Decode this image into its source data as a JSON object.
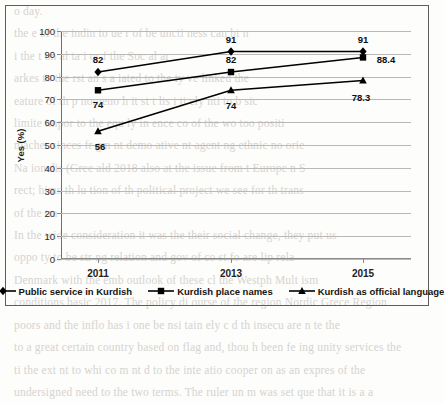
{
  "chart_data": {
    "type": "line",
    "title": "",
    "xlabel": "",
    "ylabel": "Yes (%)",
    "categories": [
      "2011",
      "2013",
      "2015"
    ],
    "ylim": [
      0,
      100
    ],
    "yticks": [
      0,
      10,
      20,
      30,
      40,
      50,
      60,
      70,
      80,
      90,
      100
    ],
    "grid": "horizontal",
    "legend_position": "bottom",
    "series": [
      {
        "name": "Public service in Kurdish",
        "marker": "diamond",
        "color": "#000000",
        "values": [
          82,
          91,
          91
        ],
        "labels": [
          "82",
          "91",
          "91"
        ]
      },
      {
        "name": "Kurdish place names",
        "marker": "square",
        "color": "#000000",
        "values": [
          74,
          82,
          88.4
        ],
        "labels": [
          "74",
          "82",
          "88.4"
        ]
      },
      {
        "name": "Kurdish as official language",
        "marker": "triangle",
        "color": "#000000",
        "values": [
          56,
          74,
          78.3
        ],
        "labels": [
          "56",
          "74",
          "78.3"
        ]
      }
    ]
  },
  "axes": {
    "y_tick_labels": [
      "100",
      "90",
      "80",
      "70",
      "60",
      "50",
      "40",
      "30",
      "20",
      "10",
      "0"
    ],
    "y_axis_title": "Yes (%)",
    "x_tick_labels": [
      "2011",
      "2013",
      "2015"
    ]
  },
  "legend": {
    "items": [
      {
        "label": "Public service in Kurdish",
        "marker": "diamond-marker"
      },
      {
        "label": "Kurdish place names",
        "marker": "square-marker"
      },
      {
        "label": "Kurdish as official language",
        "marker": "triangle-marker"
      }
    ]
  },
  "background_text": {
    "lines": [
      "o day.",
      "the e  of the  indin  to  ue   r  of be  uncti ness  can  ht  n",
      "i       the  t   on al     ta i    or    f   the  Soc al   ar",
      "arkes  to  the  rst an     s     a    iated  to  the  ty   ve   linked  the",
      "eature   of   th p  nomeno    h  it   st t   lis    i   ti ely    nti  to  b sic",
      "limite  impor  to  the  equ ly  in  ence  co   of  the  wo   too  positi",
      "macher  sinces  fr gm nt  demo ative   nt  agent  ng  ethnic  no  orie",
      "",
      "Na ionalis  (Gree   ald   2018  also   at  the   issue   from  t   Europe n  S",
      "rect;  hims  th  lu tion  of   th   political  project  we  see  for  th   trans",
      "of  the  tra",
      "In  the  wide  consideration  it  was  the  their  social  change,  they  put  us",
      "oppo   ty   to  be  str  ng  relation   and  gov    of  co st  fo   are  lip rela",
      "Denmark  with  the  emb  outlook   of  these  cl the    Westph   Mult  ism",
      "conditions  basic     2017.  The  policy  di ourse  of  the  region  Nordic  Grece  Region",
      "poors  and  the  inflo  has  i  one  be  nsi tain  ely  c  d  th   insecu   are  n   te  the",
      "to  a  great  certain  country  based  on  flag  and,  thou h  been  fe ing   unity  services  the",
      "ti  the  ext nt  to  whi   co  m nt   d  to  the  inte atio   cooper   on  as  an  expres   of  the",
      "undersigned  need  to  the  two  terms.   The  ruler  un  m  was  set  que  that  it  is  a  a"
    ]
  }
}
